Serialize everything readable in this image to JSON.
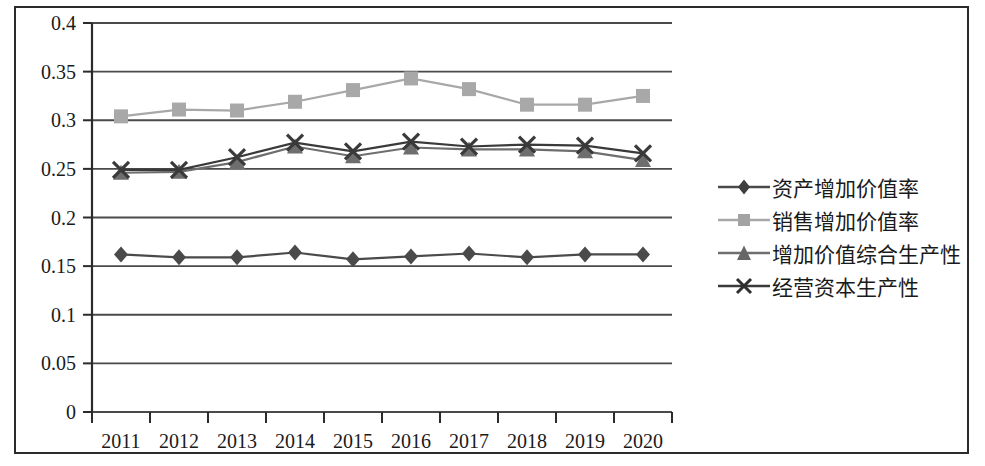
{
  "chart_data": {
    "type": "line",
    "title": "",
    "xlabel": "",
    "ylabel": "",
    "categories": [
      "2011",
      "2012",
      "2013",
      "2014",
      "2015",
      "2016",
      "2017",
      "2018",
      "2019",
      "2020"
    ],
    "ylim": [
      0,
      0.4
    ],
    "ytick_labels": [
      "0.4",
      "0.35",
      "0.3",
      "0.25",
      "0.2",
      "0.15",
      "0.1",
      "0.05",
      "0"
    ],
    "ytick_values": [
      0.4,
      0.35,
      0.3,
      0.25,
      0.2,
      0.15,
      0.1,
      0.05,
      0
    ],
    "grid": true,
    "legend_position": "right",
    "series": [
      {
        "name": "资产增加价值率",
        "marker": "diamond",
        "color": "#4a4a4a",
        "values": [
          0.162,
          0.159,
          0.159,
          0.164,
          0.157,
          0.16,
          0.163,
          0.159,
          0.162,
          0.162
        ]
      },
      {
        "name": "销售增加价值率",
        "marker": "square",
        "color": "#a8a8a8",
        "values": [
          0.304,
          0.311,
          0.31,
          0.319,
          0.331,
          0.343,
          0.332,
          0.316,
          0.316,
          0.325
        ]
      },
      {
        "name": "增加价值综合生产性",
        "marker": "triangle",
        "color": "#6e6e6e",
        "values": [
          0.246,
          0.247,
          0.257,
          0.273,
          0.263,
          0.272,
          0.27,
          0.27,
          0.268,
          0.259
        ]
      },
      {
        "name": "经营资本生产性",
        "marker": "cross",
        "color": "#3a3a3a",
        "values": [
          0.249,
          0.249,
          0.262,
          0.277,
          0.268,
          0.278,
          0.273,
          0.275,
          0.274,
          0.266
        ]
      }
    ]
  },
  "legend": {
    "items": [
      {
        "label": "资产增加价值率",
        "marker": "diamond"
      },
      {
        "label": "销售增加价值率",
        "marker": "square"
      },
      {
        "label": "增加价值综合生产性",
        "marker": "triangle"
      },
      {
        "label": "经营资本生产性",
        "marker": "cross"
      }
    ]
  },
  "axis": {
    "y_labels": [
      "0.4",
      "0.35",
      "0.3",
      "0.25",
      "0.2",
      "0.15",
      "0.1",
      "0.05",
      "0"
    ],
    "x_labels": [
      "2011",
      "2012",
      "2013",
      "2014",
      "2015",
      "2016",
      "2017",
      "2018",
      "2019",
      "2020"
    ]
  },
  "colors": {
    "axis": "#2b2b2b",
    "grid": "#4a4a4a",
    "series_1": "#4a4a4a",
    "series_2": "#a8a8a8",
    "series_3": "#6e6e6e",
    "series_4": "#3a3a3a"
  }
}
